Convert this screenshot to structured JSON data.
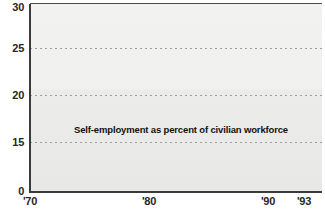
{
  "chart_data": {
    "type": "area",
    "title": "",
    "annotation": "Self-employment as percent of civilian workforce",
    "xlabel": "",
    "ylabel": "",
    "ylim": [
      0,
      30
    ],
    "y_break_between": [
      0,
      15
    ],
    "grid": true,
    "grid_style": "dotted horizontal",
    "legend_position": "none",
    "ytick_labels": [
      "30",
      "25",
      "20",
      "15",
      "0"
    ],
    "ytick_values": [
      30,
      25,
      20,
      15,
      0
    ],
    "xtick_labels": [
      "'70",
      "'80",
      "'90",
      "'93"
    ],
    "xtick_values": [
      1970,
      1980,
      1990,
      1993
    ],
    "x": [
      1970,
      1971,
      1972,
      1973,
      1974,
      1975,
      1976,
      1977,
      1978,
      1979,
      1980,
      1981,
      1982,
      1983,
      1984,
      1985,
      1986,
      1987,
      1988,
      1989,
      1990,
      1991,
      1992,
      1993
    ],
    "series": [
      {
        "name": "Self-employment as percent of civilian workforce",
        "values": [
          22.3,
          22.8,
          22.2,
          21.8,
          20.9,
          21.5,
          21.7,
          21.6,
          21.0,
          21.4,
          21.7,
          22.4,
          23.9,
          26.8,
          25.6,
          24.6,
          25.2,
          24.7,
          25.4,
          24.8,
          26.1,
          25.0,
          23.6,
          26.9
        ],
        "line_color": "#6e6e6e",
        "fill_color": "#c9c9c6"
      }
    ]
  },
  "colors": {
    "plot_bg_top": "#f2f2f0",
    "plot_bg_bottom": "#e8e8e6",
    "area_fill": "#c9c9c6",
    "line": "#6e6e6e",
    "axis": "#3b3b3b",
    "grid": "#9a9a97",
    "text": "#262626"
  },
  "axis_labels": {
    "y": [
      {
        "text": "30",
        "value": 30
      },
      {
        "text": "25",
        "value": 25
      },
      {
        "text": "20",
        "value": 20
      },
      {
        "text": "15",
        "value": 15
      },
      {
        "text": "0",
        "value": 0
      }
    ],
    "x": [
      {
        "text": "'70",
        "value": 1970
      },
      {
        "text": "'80",
        "value": 1980
      },
      {
        "text": "'90",
        "value": 1990
      },
      {
        "text": "'93",
        "value": 1993
      }
    ]
  },
  "footer": {
    "cropped_source_line": ""
  }
}
